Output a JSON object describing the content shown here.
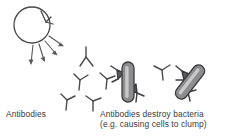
{
  "diagram": {
    "title": "Antibodies destroy bacteria",
    "background_color": "#ffffff",
    "ink_color": "#4a4a4c",
    "bacteria_fill": "#8d8d90",
    "bacteria_highlight": "#c9c9cc",
    "bacteria_outline": "#3c3c3e"
  },
  "labels": {
    "antibodies": "Antibodies",
    "right_line1": "Antibodies destroy bacteria",
    "right_line2": "(e.g. causing cells to clump)"
  },
  "elements": {
    "cell": {
      "name": "white blood cell",
      "shape": "circle"
    },
    "cell_bound_antibody": {
      "name": "antibody attached to cell"
    },
    "arrows": {
      "count": 4,
      "direction": "radiating down-right from cell"
    },
    "free_antibodies": {
      "count": 6,
      "shape": "Y"
    },
    "bacteria": [
      {
        "name": "bacterium-left",
        "orientation": "vertical",
        "antibodies_attached": 2
      },
      {
        "name": "bacterium-right",
        "orientation": "diagonal",
        "antibodies_attached": 2
      }
    ]
  }
}
